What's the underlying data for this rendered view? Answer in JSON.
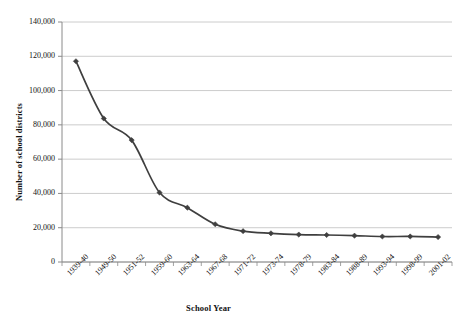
{
  "chart_data": {
    "type": "line",
    "title": "",
    "subtitle": "",
    "xlabel": "School Year",
    "ylabel": "Number of school districts",
    "categories": [
      "1939-40",
      "1949-50",
      "1951-52",
      "1959-60",
      "1963-64",
      "1967-68",
      "1971-72",
      "1973-74",
      "1978-79",
      "1983-84",
      "1988-89",
      "1993-94",
      "1998-99",
      "2001-02"
    ],
    "values": [
      117108,
      83718,
      71094,
      40520,
      31705,
      22010,
      17995,
      16730,
      16014,
      15747,
      15376,
      14881,
      14891,
      14559
    ],
    "ylim": [
      0,
      140000
    ],
    "yticks": [
      0,
      20000,
      40000,
      60000,
      80000,
      100000,
      120000,
      140000
    ],
    "ytick_labels": [
      "0",
      "20,000",
      "40,000",
      "60,000",
      "80,000",
      "100,000",
      "120,000",
      "140,000"
    ],
    "grid": true,
    "grid_axis": "y",
    "legend": false,
    "legend_position": "none",
    "series": [
      {
        "name": "Number of school districts",
        "color": "#3f3f3f",
        "marker": "diamond",
        "values": [
          117108,
          83718,
          71094,
          40520,
          31705,
          22010,
          17995,
          16730,
          16014,
          15747,
          15376,
          14881,
          14891,
          14559
        ]
      }
    ]
  },
  "style": {
    "line_color": "#3f3f3f",
    "marker_color": "#3a3a3a",
    "grid_color": "#bfbfbf",
    "axis_color": "#8a8a8a",
    "background": "#ffffff"
  },
  "layout": {
    "plot_left": 62,
    "plot_right": 452,
    "plot_top": 22,
    "plot_bottom": 262
  }
}
